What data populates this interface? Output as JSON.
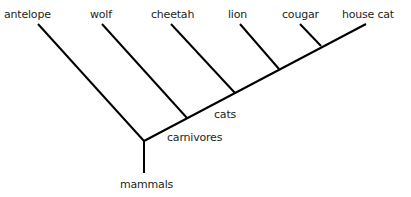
{
  "diagram": {
    "type": "cladogram",
    "line_color": "#000000",
    "text_color": "#231f20",
    "taxa": [
      {
        "id": "antelope",
        "label": "antelope",
        "x": 4,
        "y": 8
      },
      {
        "id": "wolf",
        "label": "wolf",
        "x": 90,
        "y": 8
      },
      {
        "id": "cheetah",
        "label": "cheetah",
        "x": 151,
        "y": 8
      },
      {
        "id": "lion",
        "label": "lion",
        "x": 228,
        "y": 8
      },
      {
        "id": "cougar",
        "label": "cougar",
        "x": 282,
        "y": 8
      },
      {
        "id": "house_cat",
        "label": "house cat",
        "x": 342,
        "y": 8
      }
    ],
    "clades": [
      {
        "id": "mammals",
        "label": "mammals",
        "x": 120,
        "y": 178
      },
      {
        "id": "carnivores",
        "label": "carnivores",
        "x": 167,
        "y": 131
      },
      {
        "id": "cats",
        "label": "cats",
        "x": 214,
        "y": 108
      }
    ]
  }
}
